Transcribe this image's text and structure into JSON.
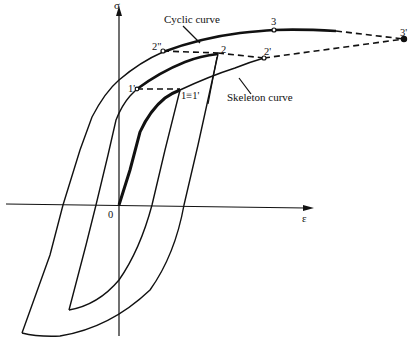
{
  "figure": {
    "type": "hysteresis-diagram",
    "axes": {
      "y_label": "σ",
      "x_label": "ε",
      "origin_label": "0"
    },
    "annotations": {
      "cyclic_curve": "Cyclic curve",
      "skeleton_curve": "Skeleton curve"
    },
    "points": {
      "p2dd": "2\"",
      "p2": "2",
      "p2d": "2'",
      "p3": "3",
      "p3d": "3'",
      "p1d": "1'",
      "p1eq": "1≡1'"
    },
    "colors": {
      "ink": "#111111",
      "background": "#ffffff"
    }
  }
}
